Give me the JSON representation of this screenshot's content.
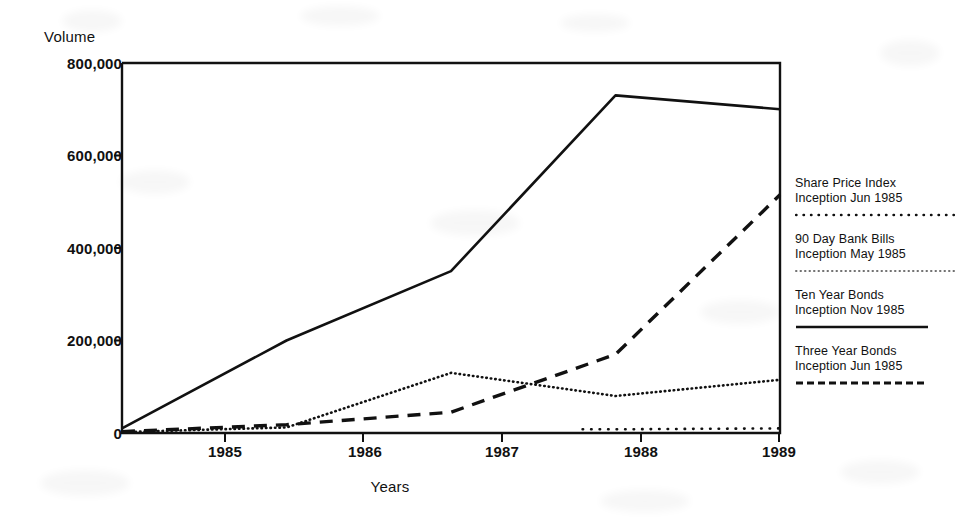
{
  "chart_data": {
    "type": "line",
    "title": "",
    "ylabel": "Volume",
    "xlabel": "Years",
    "categories": [
      "1985",
      "1986",
      "1987",
      "1988",
      "1989"
    ],
    "x": [
      1985,
      1986,
      1987,
      1988,
      1989
    ],
    "xlim": [
      1985,
      1989
    ],
    "ylim": [
      0,
      800000
    ],
    "yticks": [
      "0",
      "200,000",
      "400,000",
      "600,000",
      "800,000"
    ],
    "ytick_values": [
      0,
      200000,
      400000,
      600000,
      800000
    ],
    "xticks": [
      "1985",
      "1986",
      "1987",
      "1988",
      "1989"
    ],
    "grid": false,
    "legend_position": "right",
    "series": [
      {
        "name": "Share Price Index",
        "inception": "Inception Jun 1985",
        "style": "fine-dotted",
        "x": [
          1987.8,
          1988,
          1989
        ],
        "values": [
          8000,
          8000,
          10000
        ]
      },
      {
        "name": "90 Day Bank Bills",
        "inception": "Inception May 1985",
        "style": "dotted",
        "x": [
          1985,
          1986,
          1987,
          1988,
          1989
        ],
        "values": [
          2000,
          12000,
          130000,
          80000,
          115000
        ]
      },
      {
        "name": "Ten Year Bonds",
        "inception": "Inception Nov 1985",
        "style": "solid",
        "x": [
          1985,
          1986,
          1987,
          1988,
          1989
        ],
        "values": [
          10000,
          200000,
          350000,
          730000,
          700000
        ]
      },
      {
        "name": "Three Year Bonds",
        "inception": "Inception Jun 1985",
        "style": "dashed",
        "x": [
          1985,
          1986,
          1987,
          1988,
          1989
        ],
        "values": [
          3000,
          18000,
          45000,
          170000,
          515000
        ]
      }
    ]
  },
  "legend": {
    "entries": [
      {
        "label": "Share Price Index",
        "sublabel": "Inception Jun 1985",
        "style": "fine-dotted"
      },
      {
        "label": "90 Day Bank Bills",
        "sublabel": "Inception May 1985",
        "style": "fine-dotted"
      },
      {
        "label": "Ten Year Bonds",
        "sublabel": "Inception Nov 1985",
        "style": "solid"
      },
      {
        "label": "Three Year Bonds",
        "sublabel": "Inception Jun 1985",
        "style": "dashed"
      }
    ]
  },
  "colors": {
    "ink": "#111111",
    "background": "#ffffff"
  }
}
